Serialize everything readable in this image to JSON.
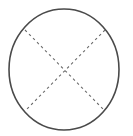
{
  "figure": {
    "canvas": {
      "width": 133,
      "height": 136,
      "background_color": "#ffffff"
    },
    "circle": {
      "label": "circle-outline",
      "center_x": 64,
      "center_y": 69.5,
      "radius_x": 55,
      "radius_y": 60.5,
      "stroke_color": "#4a4a4a",
      "stroke_width": 1.6,
      "fill": "none"
    },
    "chords": [
      {
        "label": "dashed-chord-nw-se",
        "x1": 25,
        "y1": 30,
        "x2": 105,
        "y2": 111,
        "stroke_color": "#6b6b6b",
        "stroke_width": 1.1,
        "dash_pattern": "2.6 3.1"
      },
      {
        "label": "dashed-chord-ne-sw",
        "x1": 105,
        "y1": 30,
        "x2": 25,
        "y2": 111,
        "stroke_color": "#6b6b6b",
        "stroke_width": 1.1,
        "dash_pattern": "2.6 3.1"
      }
    ],
    "intersection": {
      "label": "chord-intersection-point",
      "x": 65,
      "y": 70.5
    }
  }
}
